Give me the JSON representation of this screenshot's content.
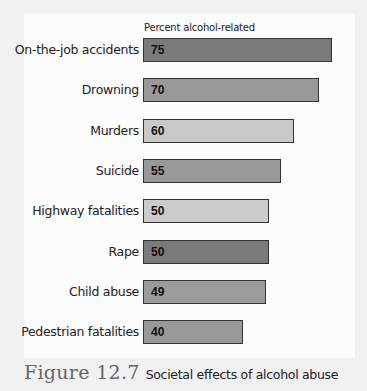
{
  "chart_data": {
    "type": "bar",
    "orientation": "horizontal",
    "title": "Societal effects of alcohol abuse",
    "figure_label": "Figure 12.7",
    "xlabel": "Percent alcohol-related",
    "ylabel": "",
    "categories": [
      "On-the-job accidents",
      "Drowning",
      "Murders",
      "Suicide",
      "Highway fatalities",
      "Rape",
      "Child abuse",
      "Pedestrian fatalities"
    ],
    "values": [
      75,
      70,
      60,
      55,
      50,
      50,
      49,
      40
    ],
    "colors": [
      "#7a7a7a",
      "#999999",
      "#c9c9c9",
      "#999999",
      "#cbcbcb",
      "#7a7a7a",
      "#9c9c9c",
      "#999999"
    ],
    "data_labels": true,
    "grid": false,
    "legend": null,
    "xlim": [
      0,
      75
    ]
  },
  "axis_title": "Percent alcohol-related",
  "bars": [
    {
      "label": "On-the-job accidents",
      "value": "75"
    },
    {
      "label": "Drowning",
      "value": "70"
    },
    {
      "label": "Murders",
      "value": "60"
    },
    {
      "label": "Suicide",
      "value": "55"
    },
    {
      "label": "Highway fatalities",
      "value": "50"
    },
    {
      "label": "Rape",
      "value": "50"
    },
    {
      "label": "Child abuse",
      "value": "49"
    },
    {
      "label": "Pedestrian fatalities",
      "value": "40"
    }
  ],
  "caption": {
    "figure": "Figure 12.7",
    "text": "Societal effects of alcohol abuse"
  }
}
